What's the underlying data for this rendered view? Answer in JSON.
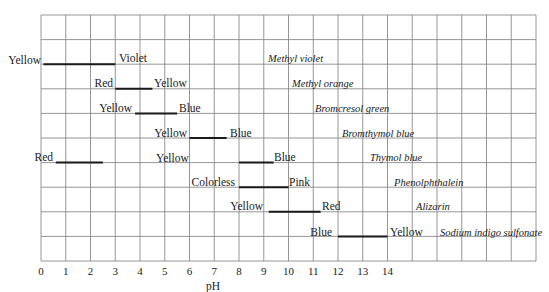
{
  "chart_data": {
    "type": "range-bar",
    "title": "",
    "xlabel": "pH",
    "ylabel": "",
    "xlim": [
      0,
      20
    ],
    "x_ticks": [
      0,
      1,
      2,
      3,
      4,
      5,
      6,
      7,
      8,
      9,
      10,
      11,
      12,
      13,
      14
    ],
    "grid": true,
    "grid_columns": 20,
    "grid_rows": 10,
    "indicators": [
      {
        "name": "Methyl violet",
        "row": 2,
        "ranges": [
          {
            "from": 0.1,
            "to": 3.0,
            "low_color": "Yellow",
            "high_color": "Violet"
          }
        ]
      },
      {
        "name": "Methyl orange",
        "row": 3,
        "ranges": [
          {
            "from": 3.0,
            "to": 4.5,
            "low_color": "Red",
            "high_color": "Yellow"
          }
        ]
      },
      {
        "name": "Bromcresol green",
        "row": 4,
        "ranges": [
          {
            "from": 3.8,
            "to": 5.5,
            "low_color": "Yellow",
            "high_color": "Blue"
          }
        ]
      },
      {
        "name": "Bromthymol blue",
        "row": 5,
        "ranges": [
          {
            "from": 6.0,
            "to": 7.5,
            "low_color": "Yellow",
            "high_color": "Blue"
          }
        ]
      },
      {
        "name": "Thymol blue",
        "row": 6,
        "ranges": [
          {
            "from": 0.6,
            "to": 2.5,
            "low_color": "Red",
            "high_color": "Yellow"
          },
          {
            "from": 8.0,
            "to": 9.4,
            "low_color": "Yellow",
            "high_color": "Blue"
          }
        ]
      },
      {
        "name": "Phenolphthalein",
        "row": 7,
        "ranges": [
          {
            "from": 8.0,
            "to": 10.0,
            "low_color": "Colorless",
            "high_color": "Pink"
          }
        ]
      },
      {
        "name": "Alizarin",
        "row": 8,
        "ranges": [
          {
            "from": 9.2,
            "to": 11.3,
            "low_color": "Yellow",
            "high_color": "Red"
          }
        ]
      },
      {
        "name": "Sodium indigo sulfonate",
        "row": 9,
        "ranges": [
          {
            "from": 12.0,
            "to": 14.0,
            "low_color": "Blue",
            "high_color": "Yellow"
          }
        ]
      }
    ]
  },
  "labels": {
    "mv_low": "Yellow",
    "mv_high": "Violet",
    "mv_name": "Methyl violet",
    "mo_low": "Red",
    "mo_high": "Yellow",
    "mo_name": "Methyl orange",
    "bg_low": "Yellow",
    "bg_high": "Blue",
    "bg_name": "Bromcresol green",
    "bb_low": "Yellow",
    "bb_high": "Blue",
    "bb_name": "Bromthymol blue",
    "tb_low": "Red",
    "tb_mid": "Yellow",
    "tb_high": "Blue",
    "tb_name": "Thymol blue",
    "ph_low": "Colorless",
    "ph_high": "Pink",
    "ph_name": "Phenolphthalein",
    "al_low": "Yellow",
    "al_high": "Red",
    "al_name": "Alizarin",
    "si_low": "Blue",
    "si_high": "Yellow",
    "si_name": "Sodium indigo sulfonate",
    "x_title": "pH",
    "ticks": [
      "0",
      "1",
      "2",
      "3",
      "4",
      "5",
      "6",
      "7",
      "8",
      "9",
      "10",
      "11",
      "12",
      "13",
      "14"
    ]
  },
  "colors": {
    "grid": "#8a8a8a",
    "bar": "#1a1a1a",
    "text": "#1a1a1a"
  }
}
